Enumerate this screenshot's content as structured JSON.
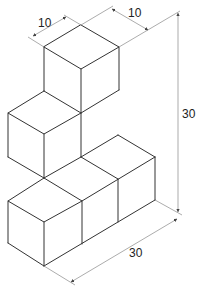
{
  "figure": {
    "type": "isometric cube assembly",
    "colors": {
      "edge": "#333333",
      "dimension": "#888888",
      "text": "#222222",
      "background": "#ffffff"
    },
    "dimensions": {
      "top_left_width": "10",
      "top_right_depth": "10",
      "overall_height": "30",
      "overall_length": "30"
    }
  }
}
